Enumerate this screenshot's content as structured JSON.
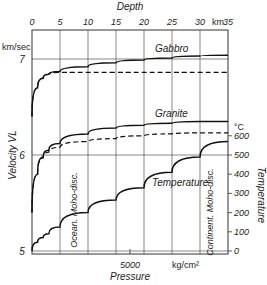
{
  "chart_data": {
    "type": "line",
    "title": "",
    "top_axis": {
      "label": "Depth",
      "unit": "km.",
      "ticks": [
        "0",
        "5",
        "10",
        "15",
        "20",
        "25",
        "30",
        "35"
      ],
      "range": [
        0,
        35
      ]
    },
    "bottom_axis": {
      "label": "Pressure",
      "unit": "kg/cm²",
      "ticks": [
        "5000"
      ]
    },
    "left_axis": {
      "label": "Velocity VL",
      "unit": "km/sec",
      "ticks": [
        "5",
        "6",
        "7"
      ],
      "range": [
        5,
        7.05
      ]
    },
    "right_axis": {
      "label": "Temperature",
      "unit": "°C",
      "ticks": [
        "0",
        "100",
        "200",
        "300",
        "400",
        "500",
        "600"
      ],
      "range": [
        0,
        600
      ]
    },
    "annotations": {
      "gabbro": "Gabbro",
      "granite": "Granite",
      "temperature": "Temperature",
      "ocean_moho": "Ocean. Moho-disc.",
      "continent_moho": "Continent. Moho-disc."
    },
    "x": [
      0,
      1,
      2,
      3,
      5,
      10,
      15,
      20,
      25,
      30,
      35
    ],
    "series": [
      {
        "name": "Gabbro (solid)",
        "axis": "left",
        "style": "solid",
        "values": [
          6.4,
          6.7,
          6.8,
          6.84,
          6.87,
          6.92,
          6.96,
          6.99,
          7.01,
          7.03,
          7.04
        ]
      },
      {
        "name": "Gabbro (dashed)",
        "axis": "left",
        "style": "dashed",
        "values": [
          6.4,
          6.7,
          6.8,
          6.84,
          6.86,
          6.86,
          6.86,
          6.86,
          6.86,
          6.86,
          6.86
        ]
      },
      {
        "name": "Granite (solid)",
        "axis": "left",
        "style": "solid",
        "values": [
          5.4,
          5.8,
          5.98,
          6.05,
          6.12,
          6.22,
          6.28,
          6.31,
          6.33,
          6.35,
          6.35
        ]
      },
      {
        "name": "Granite (dashed)",
        "axis": "left",
        "style": "dashed",
        "values": [
          5.4,
          5.8,
          5.97,
          6.03,
          6.08,
          6.14,
          6.17,
          6.2,
          6.22,
          6.23,
          6.23
        ]
      },
      {
        "name": "Temperature",
        "axis": "right",
        "style": "solid",
        "values": [
          0,
          45,
          70,
          90,
          125,
          200,
          265,
          330,
          410,
          490,
          570
        ]
      }
    ],
    "grid": true,
    "legend": "none"
  }
}
